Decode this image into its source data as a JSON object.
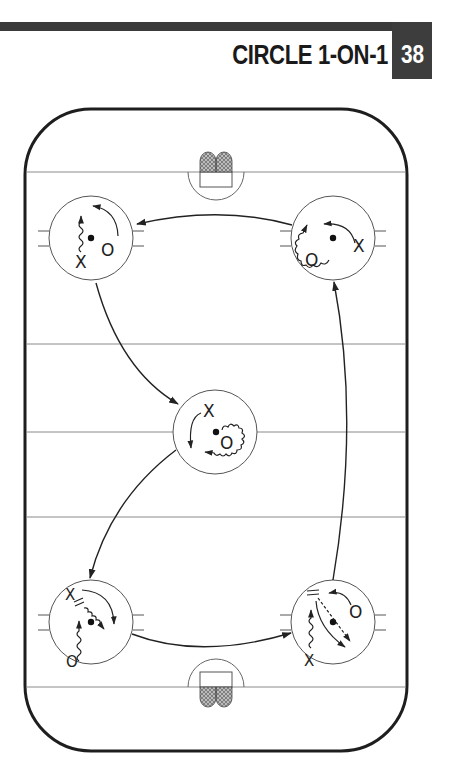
{
  "header": {
    "title": "CIRCLE 1-ON-1",
    "drill_number": "38",
    "bar_color": "#3a3a3a"
  },
  "diagram": {
    "type": "hockey-rink-drill",
    "rink": {
      "x": 25,
      "y": 109,
      "width": 382,
      "height": 642,
      "corner_radius": 66,
      "border_color": "#1e1e1e"
    },
    "lines_y": [
      172,
      344,
      432,
      517,
      687
    ],
    "faceoff_circles": [
      {
        "id": "top-left",
        "cx": 91,
        "cy": 238,
        "r": 42,
        "players": [
          {
            "label": "X",
            "x": 81,
            "y": 268
          },
          {
            "label": "O",
            "x": 107,
            "y": 256
          }
        ]
      },
      {
        "id": "top-right",
        "cx": 333,
        "cy": 238,
        "r": 42,
        "players": [
          {
            "label": "X",
            "x": 359,
            "y": 252
          },
          {
            "label": "O",
            "x": 311,
            "y": 266
          }
        ]
      },
      {
        "id": "center",
        "cx": 215,
        "cy": 432,
        "r": 42,
        "players": [
          {
            "label": "X",
            "x": 209,
            "y": 417
          },
          {
            "label": "O",
            "x": 226,
            "y": 447
          }
        ]
      },
      {
        "id": "bottom-left",
        "cx": 91,
        "cy": 622,
        "r": 42,
        "players": [
          {
            "label": "X",
            "x": 71,
            "y": 594
          },
          {
            "label": "O",
            "x": 72,
            "y": 667
          }
        ]
      },
      {
        "id": "bottom-right",
        "cx": 333,
        "cy": 622,
        "r": 42,
        "players": [
          {
            "label": "X",
            "x": 310,
            "y": 660
          },
          {
            "label": "O",
            "x": 355,
            "y": 618
          }
        ]
      }
    ],
    "flow": [
      "top-right",
      "top-left",
      "center",
      "bottom-left",
      "bottom-right",
      "top-right"
    ],
    "legend_glyphs": {
      "skate": "solid-arrow",
      "skate_with_puck": "wavy-arrow",
      "pass": "dashed-arrow",
      "stop": "double-bar"
    }
  }
}
